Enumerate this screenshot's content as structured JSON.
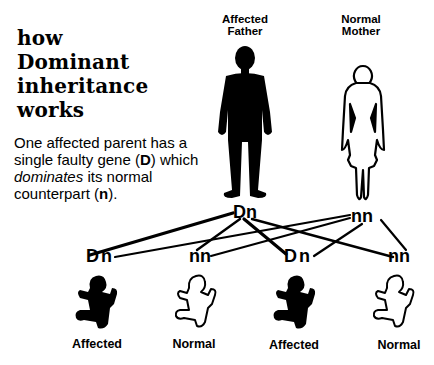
{
  "title": {
    "lines": [
      "how",
      "Dominant",
      "inheritance",
      "works"
    ]
  },
  "description": {
    "part1": "One affected parent has a single faulty gene (",
    "dominant_gene": "D",
    "part2": ") which ",
    "emphasis": "dominates",
    "part3": " its normal counterpart (",
    "recessive_gene": "n",
    "part4": ")."
  },
  "parents": [
    {
      "label_line1": "Affected",
      "label_line2": "Father",
      "genotype": "Dn",
      "status": "affected",
      "fill": "#000000"
    },
    {
      "label_line1": "Normal",
      "label_line2": "Mother",
      "genotype": "nn",
      "status": "normal",
      "fill": "#ffffff"
    }
  ],
  "children": [
    {
      "genotype": "Dn",
      "label": "Affected",
      "status": "affected"
    },
    {
      "genotype": "nn",
      "label": "Normal",
      "status": "normal"
    },
    {
      "genotype": "Dn",
      "label": "Affected",
      "status": "affected"
    },
    {
      "genotype": "nn",
      "label": "Normal",
      "status": "normal"
    }
  ],
  "colors": {
    "ink": "#000000",
    "background": "#ffffff"
  }
}
